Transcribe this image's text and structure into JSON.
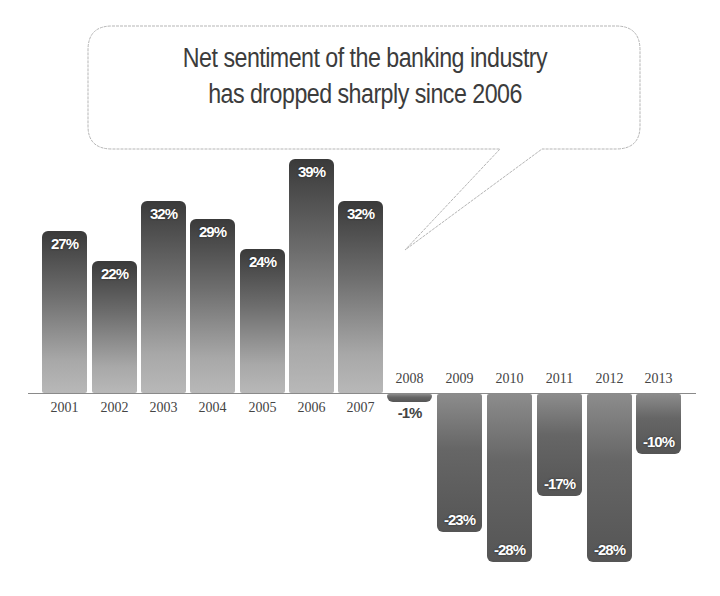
{
  "callout": {
    "line1": "Net sentiment of the banking industry",
    "line2": "has dropped sharply since 2006"
  },
  "colors": {
    "bar_dark": "#3a3a3a",
    "bar_light": "#b8b8b8",
    "text": "#3c3c3c",
    "axis": "#8a8a8a"
  },
  "chart_data": {
    "type": "bar",
    "title": "Net sentiment of the banking industry has dropped sharply since 2006",
    "xlabel": "",
    "ylabel": "Net sentiment (%)",
    "categories": [
      "2001",
      "2002",
      "2003",
      "2004",
      "2005",
      "2006",
      "2007",
      "2008",
      "2009",
      "2010",
      "2011",
      "2012",
      "2013"
    ],
    "values": [
      27,
      22,
      32,
      29,
      24,
      39,
      32,
      -1,
      -23,
      -28,
      -17,
      -28,
      -10
    ],
    "labels": [
      "27%",
      "22%",
      "32%",
      "29%",
      "24%",
      "39%",
      "32%",
      "-1%",
      "-23%",
      "-28%",
      "-17%",
      "-28%",
      "-10%"
    ],
    "ylim": [
      -30,
      40
    ],
    "grid": false,
    "legend": "none",
    "annotations": [
      "Net sentiment of the banking industry has dropped sharply since 2006"
    ]
  }
}
